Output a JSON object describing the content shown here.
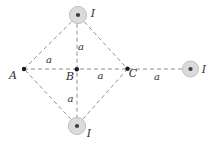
{
  "figure": {
    "points": {
      "A": "A",
      "B": "B",
      "C": "C"
    },
    "wires": {
      "top": "I",
      "bottom": "I",
      "right": "I"
    },
    "distances": {
      "a_to_b": "a",
      "b_to_top": "a",
      "b_to_c": "a",
      "b_to_bottom": "a",
      "c_to_right": "a"
    },
    "colors": {
      "background": "#ffffff",
      "dashed_line": "#8f8f8f",
      "point_dot": "#1c1c1c",
      "wire_fill": "#dbdbdb",
      "wire_ring": "#bfbfbf",
      "wire_center_dot": "#3d3d3d",
      "label": "#2e2e2e"
    }
  }
}
